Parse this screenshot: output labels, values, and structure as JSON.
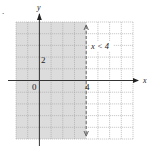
{
  "figure": {
    "bullet": ".",
    "inequality_label": "x < 4",
    "axis_labels": {
      "x": "x",
      "y": "y"
    },
    "tick_labels": {
      "origin": "0",
      "x_tick": "4",
      "y_tick": "2"
    },
    "colors": {
      "shade": "#dcdcdc",
      "grid": "#a8a8a8",
      "axis": "#333333",
      "boundary": "#666666",
      "background": "#ffffff"
    },
    "grid": {
      "x_min": -2,
      "x_max": 8,
      "y_min": -5,
      "y_max": 5,
      "cell_px": 11.7
    },
    "boundary": {
      "x": 4,
      "style": "dashed",
      "shaded_side": "left"
    }
  }
}
